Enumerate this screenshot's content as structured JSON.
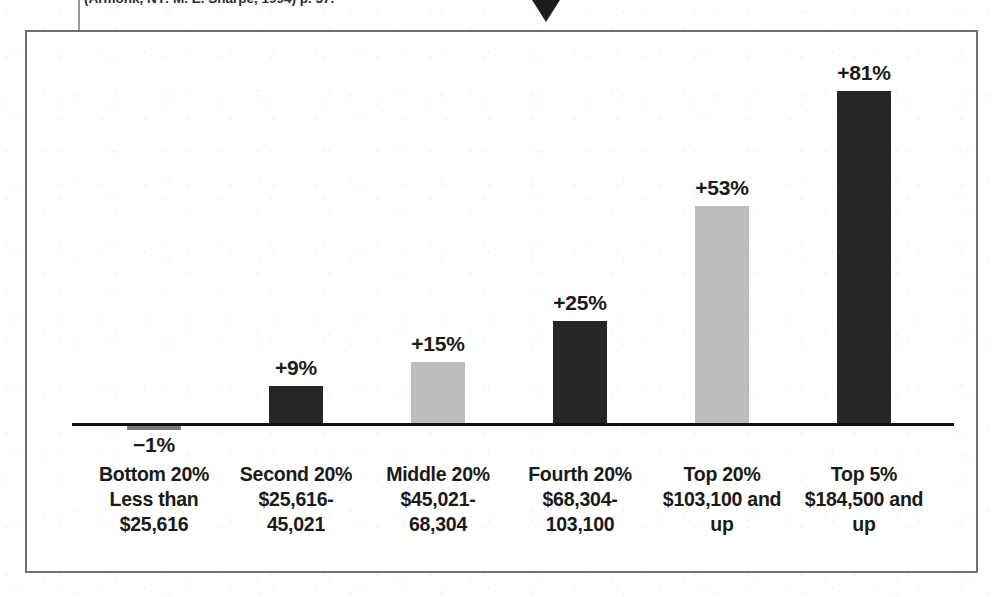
{
  "page": {
    "citation_fragment": "(Armonk, NY: M. E. Sharpe, 1994) p. 57.",
    "pointer_icon": "down-triangle-icon"
  },
  "colors": {
    "bar_dark": "#262626",
    "bar_light": "#bdbdbd",
    "bar_negative": "#7a7a7a",
    "axis": "#111111",
    "frame": "#6f6f6f",
    "background": "#ffffff",
    "text": "#1a1a1a"
  },
  "chart_data": {
    "type": "bar",
    "title": "",
    "subtitle": "",
    "xlabel": "",
    "ylabel": "",
    "grid": false,
    "legend": "none",
    "ylim": [
      -10,
      90
    ],
    "baseline": 0,
    "categories": [
      "Bottom 20%",
      "Second 20%",
      "Middle 20%",
      "Fourth 20%",
      "Top 20%",
      "Top 5%"
    ],
    "values": [
      -1,
      9,
      15,
      25,
      53,
      81
    ],
    "data_labels": [
      "−1%",
      "+9%",
      "+15%",
      "+25%",
      "+53%",
      "+81%"
    ],
    "bars": [
      {
        "category": "Bottom 20%",
        "value": -1,
        "label": "−1%",
        "shade": "negative",
        "caption_lines": [
          "Bottom 20%",
          "Less than",
          "$25,616"
        ],
        "income_range": "Less than $25,616"
      },
      {
        "category": "Second 20%",
        "value": 9,
        "label": "+9%",
        "shade": "dark",
        "caption_lines": [
          "Second 20%",
          "$25,616-",
          "45,021"
        ],
        "income_range": "$25,616-45,021"
      },
      {
        "category": "Middle 20%",
        "value": 15,
        "label": "+15%",
        "shade": "light",
        "caption_lines": [
          "Middle 20%",
          "$45,021-",
          "68,304"
        ],
        "income_range": "$45,021-68,304"
      },
      {
        "category": "Fourth 20%",
        "value": 25,
        "label": "+25%",
        "shade": "dark",
        "caption_lines": [
          "Fourth 20%",
          "$68,304-",
          "103,100"
        ],
        "income_range": "$68,304-103,100"
      },
      {
        "category": "Top 20%",
        "value": 53,
        "label": "+53%",
        "shade": "light",
        "caption_lines": [
          "Top 20%",
          "$103,100 and",
          "up"
        ],
        "income_range": "$103,100 and up"
      },
      {
        "category": "Top 5%",
        "value": 81,
        "label": "+81%",
        "shade": "dark",
        "caption_lines": [
          "Top 5%",
          "$184,500 and",
          "up"
        ],
        "income_range": "$184,500 and up"
      }
    ]
  }
}
